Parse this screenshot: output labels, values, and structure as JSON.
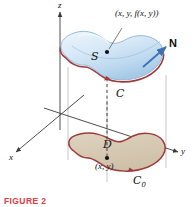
{
  "figure": {
    "caption": "FIGURE 2",
    "caption_color": "#e03a3e",
    "background": "#ffffff",
    "width": 195,
    "height": 207
  },
  "axes": {
    "x_label": "x",
    "y_label": "y",
    "z_label": "z",
    "axis_color": "#3a3a3a",
    "origin": {
      "x": 60,
      "y": 113
    }
  },
  "labels": {
    "surface_point": "(x, y, f(x, y))",
    "domain_point": "(x, y)",
    "surface": "S",
    "domain": "D",
    "curve": "C",
    "curve_base": "C",
    "curve_base_subscript": "0",
    "normal": "N"
  },
  "colors": {
    "surface_fill_light": "#e8f2fb",
    "surface_fill_mid": "#c7ddf0",
    "surface_fill_deep": "#a9cbe8",
    "surface_edge_top": "#7fa8cf",
    "curve_red": "#a03a3a",
    "domain_fill": "#d9cdb8",
    "domain_edge": "#a03a3a",
    "normal_arrow": "#3f6fb5",
    "projection_line": "#bcbcbc",
    "dashed_line": "#2b2b2b"
  },
  "geometry": {
    "surface_note": "kidney-shaped surface S sitting above planar region D",
    "projection_lines": 3,
    "dashed_drop_line": true,
    "normal_vector_direction": "up-right"
  }
}
